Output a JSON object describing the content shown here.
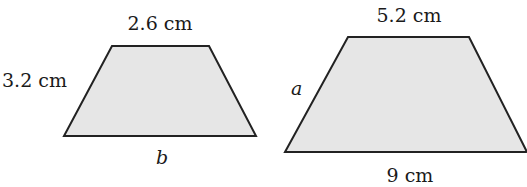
{
  "figures": [
    {
      "name": "trapezoid-left",
      "top_label": "2.6 cm",
      "side_label": "3.2 cm",
      "bottom_label": "b",
      "points": "112,46 209,46 256,136 64,136"
    },
    {
      "name": "trapezoid-right",
      "top_label": "5.2 cm",
      "side_label": "a",
      "bottom_label": "9 cm",
      "points": "348,37 469,37 527,152 285,152"
    }
  ],
  "colors": {
    "fill": "#e6e6e6",
    "stroke": "#222222"
  }
}
